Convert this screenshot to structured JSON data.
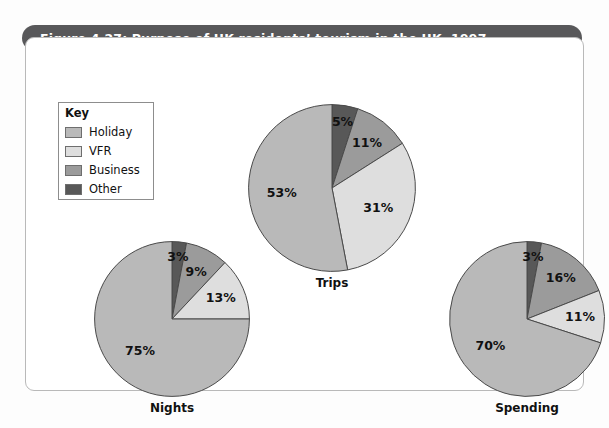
{
  "figure": {
    "title": "Figure 4.27: Purpose of UK residents’ tourism in the UK, 1997"
  },
  "legend": {
    "title": "Key",
    "items": [
      {
        "label": "Holiday",
        "color": "#b9b9b9"
      },
      {
        "label": "VFR",
        "color": "#dedede"
      },
      {
        "label": "Business",
        "color": "#9b9b9b"
      },
      {
        "label": "Other",
        "color": "#585858"
      }
    ]
  },
  "chart_data": [
    {
      "type": "pie",
      "title": "Trips",
      "categories": [
        "Other",
        "Business",
        "VFR",
        "Holiday"
      ],
      "values": [
        5,
        11,
        31,
        53
      ],
      "labels": [
        "5%",
        "11%",
        "31%",
        "53%"
      ],
      "colors": [
        "#585858",
        "#9b9b9b",
        "#dedede",
        "#b9b9b9"
      ],
      "units": "percent",
      "start_angle_deg": 0,
      "direction": "clockwise",
      "legend_position": "top-left"
    },
    {
      "type": "pie",
      "title": "Nights",
      "categories": [
        "Other",
        "Business",
        "VFR",
        "Holiday"
      ],
      "values": [
        3,
        9,
        13,
        75
      ],
      "labels": [
        "3%",
        "9%",
        "13%",
        "75%"
      ],
      "colors": [
        "#585858",
        "#9b9b9b",
        "#dedede",
        "#b9b9b9"
      ],
      "units": "percent",
      "start_angle_deg": 0,
      "direction": "clockwise",
      "legend_position": "top-left"
    },
    {
      "type": "pie",
      "title": "Spending",
      "categories": [
        "Other",
        "Business",
        "VFR",
        "Holiday"
      ],
      "values": [
        3,
        16,
        11,
        70
      ],
      "labels": [
        "3%",
        "16%",
        "11%",
        "70%"
      ],
      "colors": [
        "#585858",
        "#9b9b9b",
        "#dedede",
        "#b9b9b9"
      ],
      "units": "percent",
      "start_angle_deg": 0,
      "direction": "clockwise",
      "legend_position": "top-left"
    }
  ],
  "pie_layout": [
    {
      "name": "trips",
      "left": 222,
      "top": 66,
      "size": 168,
      "label_radius_factor": 0.6
    },
    {
      "name": "nights",
      "left": 68,
      "top": 203,
      "size": 156,
      "label_radius_factor": 0.58
    },
    {
      "name": "spending",
      "left": 423,
      "top": 203,
      "size": 156,
      "label_radius_factor": 0.58
    }
  ]
}
